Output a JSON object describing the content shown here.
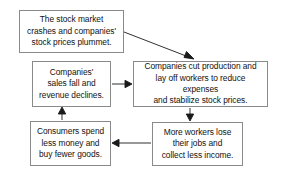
{
  "diagram": {
    "background_color": "#ffffff",
    "border_color": "#8a8a8a",
    "text_color": "#111111",
    "arrow_color": "#1a1a1a",
    "nodes": [
      {
        "id": "stock-crash",
        "text": "The stock market\ncrashes and companies'\nstock prices plummet."
      },
      {
        "id": "sales-fall",
        "text": "Companies'\nsales fall and\nrevenue declines."
      },
      {
        "id": "cut-production",
        "text": "Companies cut production and\nlay off workers to reduce expenses\nand stabilize stock prices."
      },
      {
        "id": "workers-lose",
        "text": "More workers lose\ntheir jobs and\ncollect less income."
      },
      {
        "id": "consumers-spend",
        "text": "Consumers spend\nless money and\nbuy fewer goods."
      }
    ],
    "arrows": [
      {
        "id": "crash-to-cut",
        "from": "stock-crash",
        "to": "cut-production",
        "direction": "diagonal-down-right"
      },
      {
        "id": "sales-to-cut",
        "from": "sales-fall",
        "to": "cut-production",
        "direction": "right"
      },
      {
        "id": "cut-to-workers",
        "from": "cut-production",
        "to": "workers-lose",
        "direction": "down"
      },
      {
        "id": "workers-to-consumers",
        "from": "workers-lose",
        "to": "consumers-spend",
        "direction": "left"
      },
      {
        "id": "consumers-to-sales",
        "from": "consumers-spend",
        "to": "sales-fall",
        "direction": "up"
      }
    ]
  }
}
